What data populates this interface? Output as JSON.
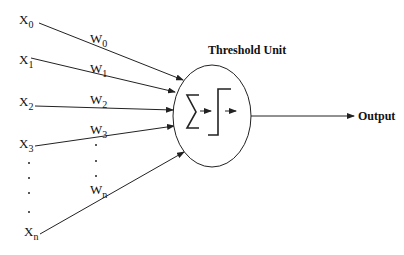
{
  "diagram": {
    "title": "Threshold Unit",
    "output_label": "Output",
    "inputs": [
      {
        "name": "X",
        "sub": "0"
      },
      {
        "name": "X",
        "sub": "1"
      },
      {
        "name": "X",
        "sub": "2"
      },
      {
        "name": "X",
        "sub": "3"
      },
      {
        "name": "X",
        "sub": "n"
      }
    ],
    "weights": [
      {
        "name": "W",
        "sub": "0"
      },
      {
        "name": "W",
        "sub": "1"
      },
      {
        "name": "W",
        "sub": "2"
      },
      {
        "name": "W",
        "sub": "3"
      },
      {
        "name": "W",
        "sub": "n"
      }
    ],
    "icons": {
      "summation": "sigma-icon",
      "step_function": "step-function-icon"
    },
    "colors": {
      "stroke": "#222222",
      "text": "#111111",
      "background": "#ffffff"
    }
  }
}
